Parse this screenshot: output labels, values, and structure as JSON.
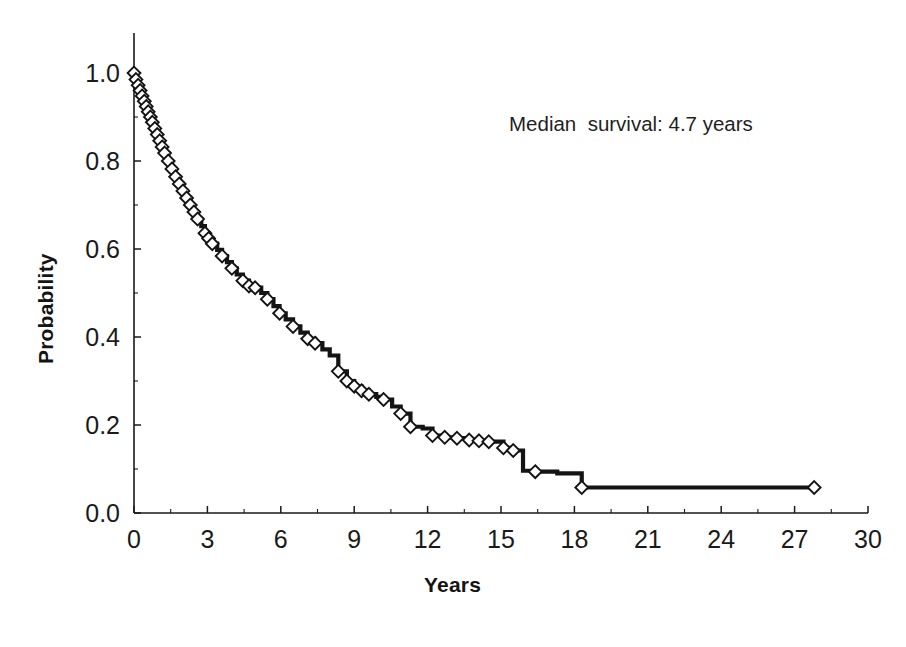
{
  "figure": {
    "background": "#ffffff",
    "ink_color": "#1a1a1a",
    "curve_color": "#141414"
  },
  "axes": {
    "x_title": "Years",
    "y_title": "Probability",
    "x_ticks": [
      "0",
      "3",
      "6",
      "9",
      "12",
      "15",
      "18",
      "21",
      "24",
      "27",
      "30"
    ],
    "y_ticks": [
      "1.0",
      "0.8",
      "0.6",
      "0.4",
      "0.2",
      "0.0"
    ]
  },
  "annotation": {
    "median_survival_text": "Median  survival: 4.7 years"
  },
  "chart_data": {
    "type": "line",
    "subtype": "kaplan-meier-survival-step",
    "title": "",
    "subtitle": "",
    "xlabel": "Years",
    "ylabel": "Probability",
    "xlim": [
      0,
      30
    ],
    "ylim": [
      0.0,
      1.0
    ],
    "xticks": [
      0,
      3,
      6,
      9,
      12,
      15,
      18,
      21,
      24,
      27,
      30
    ],
    "yticks": [
      0.0,
      0.2,
      0.4,
      0.6,
      0.8,
      1.0
    ],
    "x_minor_tick_interval": 1.5,
    "y_minor_tick_interval": 0.1,
    "grid": false,
    "legend": null,
    "annotations": [
      {
        "text": "Median  survival: 4.7 years",
        "x": 16.2,
        "y": 0.9
      }
    ],
    "median_survival_years": 4.7,
    "series": [
      {
        "name": "Survival probability",
        "marker": "open-diamond",
        "marker_meaning": "censored observation",
        "line_style": "step-post",
        "x": [
          0.0,
          0.08,
          0.17,
          0.25,
          0.33,
          0.42,
          0.5,
          0.58,
          0.67,
          0.75,
          0.85,
          0.95,
          1.05,
          1.15,
          1.25,
          1.4,
          1.55,
          1.7,
          1.85,
          2.0,
          2.15,
          2.3,
          2.45,
          2.6,
          2.75,
          2.9,
          3.05,
          3.2,
          3.4,
          3.6,
          3.8,
          4.0,
          4.2,
          4.45,
          4.7,
          4.95,
          5.2,
          5.45,
          5.7,
          5.95,
          6.2,
          6.5,
          6.8,
          7.1,
          7.4,
          7.7,
          8.0,
          8.35,
          8.7,
          9.0,
          9.3,
          9.6,
          9.9,
          10.2,
          10.55,
          10.9,
          11.3,
          11.8,
          12.2,
          12.7,
          13.2,
          13.7,
          14.1,
          14.5,
          15.1,
          15.5,
          15.9,
          16.4,
          17.3,
          18.3,
          27.8
        ],
        "y": [
          1.0,
          0.985,
          0.972,
          0.96,
          0.948,
          0.936,
          0.924,
          0.912,
          0.9,
          0.888,
          0.874,
          0.86,
          0.846,
          0.832,
          0.818,
          0.8,
          0.782,
          0.764,
          0.748,
          0.732,
          0.716,
          0.7,
          0.684,
          0.668,
          0.652,
          0.636,
          0.624,
          0.612,
          0.598,
          0.584,
          0.57,
          0.556,
          0.542,
          0.528,
          0.516,
          0.512,
          0.5,
          0.486,
          0.47,
          0.454,
          0.44,
          0.424,
          0.41,
          0.396,
          0.386,
          0.372,
          0.358,
          0.322,
          0.3,
          0.288,
          0.278,
          0.27,
          0.264,
          0.258,
          0.242,
          0.226,
          0.196,
          0.192,
          0.176,
          0.172,
          0.17,
          0.166,
          0.164,
          0.162,
          0.148,
          0.142,
          0.096,
          0.094,
          0.09,
          0.058,
          0.058
        ],
        "censored_points": [
          {
            "x": 0.0,
            "y": 1.0
          },
          {
            "x": 0.08,
            "y": 0.985
          },
          {
            "x": 0.17,
            "y": 0.972
          },
          {
            "x": 0.25,
            "y": 0.96
          },
          {
            "x": 0.33,
            "y": 0.948
          },
          {
            "x": 0.42,
            "y": 0.936
          },
          {
            "x": 0.5,
            "y": 0.924
          },
          {
            "x": 0.58,
            "y": 0.912
          },
          {
            "x": 0.67,
            "y": 0.9
          },
          {
            "x": 0.75,
            "y": 0.888
          },
          {
            "x": 0.85,
            "y": 0.874
          },
          {
            "x": 0.95,
            "y": 0.86
          },
          {
            "x": 1.05,
            "y": 0.846
          },
          {
            "x": 1.15,
            "y": 0.832
          },
          {
            "x": 1.25,
            "y": 0.818
          },
          {
            "x": 1.4,
            "y": 0.8
          },
          {
            "x": 1.55,
            "y": 0.782
          },
          {
            "x": 1.7,
            "y": 0.764
          },
          {
            "x": 1.85,
            "y": 0.748
          },
          {
            "x": 2.0,
            "y": 0.732
          },
          {
            "x": 2.15,
            "y": 0.716
          },
          {
            "x": 2.3,
            "y": 0.7
          },
          {
            "x": 2.45,
            "y": 0.684
          },
          {
            "x": 2.6,
            "y": 0.668
          },
          {
            "x": 2.9,
            "y": 0.636
          },
          {
            "x": 3.05,
            "y": 0.624
          },
          {
            "x": 3.2,
            "y": 0.612
          },
          {
            "x": 3.6,
            "y": 0.584
          },
          {
            "x": 4.0,
            "y": 0.556
          },
          {
            "x": 4.45,
            "y": 0.528
          },
          {
            "x": 4.7,
            "y": 0.516
          },
          {
            "x": 4.95,
            "y": 0.512
          },
          {
            "x": 5.45,
            "y": 0.486
          },
          {
            "x": 5.95,
            "y": 0.454
          },
          {
            "x": 6.5,
            "y": 0.424
          },
          {
            "x": 7.1,
            "y": 0.396
          },
          {
            "x": 7.4,
            "y": 0.386
          },
          {
            "x": 8.35,
            "y": 0.322
          },
          {
            "x": 8.7,
            "y": 0.3
          },
          {
            "x": 9.0,
            "y": 0.288
          },
          {
            "x": 9.3,
            "y": 0.278
          },
          {
            "x": 9.6,
            "y": 0.27
          },
          {
            "x": 10.2,
            "y": 0.258
          },
          {
            "x": 10.9,
            "y": 0.226
          },
          {
            "x": 11.3,
            "y": 0.196
          },
          {
            "x": 12.2,
            "y": 0.176
          },
          {
            "x": 12.7,
            "y": 0.172
          },
          {
            "x": 13.2,
            "y": 0.17
          },
          {
            "x": 13.7,
            "y": 0.166
          },
          {
            "x": 14.1,
            "y": 0.164
          },
          {
            "x": 14.5,
            "y": 0.162
          },
          {
            "x": 15.1,
            "y": 0.148
          },
          {
            "x": 15.5,
            "y": 0.142
          },
          {
            "x": 16.4,
            "y": 0.094
          },
          {
            "x": 18.3,
            "y": 0.058
          },
          {
            "x": 27.8,
            "y": 0.058
          }
        ]
      }
    ]
  }
}
